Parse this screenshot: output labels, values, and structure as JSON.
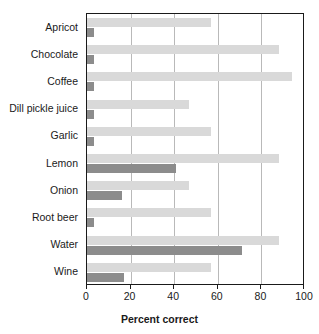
{
  "chart_data": {
    "type": "bar",
    "orientation": "horizontal",
    "title": "",
    "xlabel": "Percent correct",
    "ylabel": "",
    "xlim": [
      0,
      100
    ],
    "xticks": [
      0,
      20,
      40,
      60,
      80,
      100
    ],
    "xticklabels": [
      "0",
      "20",
      "40",
      "60",
      "80",
      "100"
    ],
    "grid": true,
    "grid_axis": "x",
    "legend": "none",
    "categories": [
      "Apricot",
      "Chocolate",
      "Coffee",
      "Dill pickle juice",
      "Garlic",
      "Lemon",
      "Onion",
      "Root beer",
      "Water",
      "Wine"
    ],
    "series": [
      {
        "name": "light",
        "color": "#d9d9d9",
        "values": [
          57,
          88,
          94,
          47,
          57,
          88,
          47,
          57,
          88,
          57
        ]
      },
      {
        "name": "dark",
        "color": "#8c8c8c",
        "values": [
          3,
          3,
          3,
          3,
          3,
          41,
          16,
          3,
          71,
          17
        ]
      }
    ]
  },
  "axis": {
    "xlabel": "Percent correct"
  },
  "colors": {
    "light_bar": "#d9d9d9",
    "dark_bar": "#8c8c8c",
    "frame": "#1a1a1a",
    "gridline": "#b9b9b9",
    "background": "#ffffff"
  }
}
